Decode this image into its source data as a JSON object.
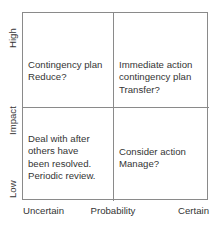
{
  "chart_data": {
    "type": "table",
    "title": "",
    "xlabel": "Probability",
    "ylabel": "Impact",
    "grid": true,
    "legend": "none",
    "axes": {
      "x": {
        "title": "Probability",
        "tick_labels": [
          "Uncertain",
          "Certain"
        ],
        "low_label": "Uncertain",
        "high_label": "Certain"
      },
      "y": {
        "title": "Impact",
        "tick_labels": [
          "Low",
          "High"
        ],
        "low_label": "Low",
        "high_label": "High"
      }
    },
    "categories": [
      "Uncertain",
      "Certain"
    ],
    "cells": [
      {
        "row": "High",
        "column": "Uncertain",
        "position": "top-left",
        "text": "Contingency plan\nReduce?"
      },
      {
        "row": "High",
        "column": "Certain",
        "position": "top-right",
        "text": "Immediate action\ncontingency plan\nTransfer?"
      },
      {
        "row": "Low",
        "column": "Uncertain",
        "position": "bottom-left",
        "text": "Deal with after\nothers have\nbeen resolved.\nPeriodic review."
      },
      {
        "row": "Low",
        "column": "Certain",
        "position": "bottom-right",
        "text": "Consider action\nManage?"
      }
    ]
  },
  "colors": {
    "border": "#8a8a8a",
    "text": "#343434",
    "background": "#ffffff"
  }
}
